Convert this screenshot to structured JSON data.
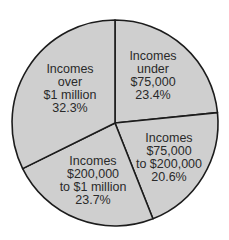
{
  "chart_data": {
    "type": "pie",
    "title": "",
    "categories": [
      "Incomes under $75,000",
      "Incomes $75,000 to $200,000",
      "Incomes $200,000 to $1 million",
      "Incomes over $1 million"
    ],
    "values": [
      23.4,
      20.6,
      23.7,
      32.3
    ],
    "unit": "%",
    "start_angle_deg": 90,
    "direction": "clockwise",
    "legend": "none (labels inside slices)",
    "slices": [
      {
        "lines": [
          "Incomes",
          "under",
          "$75,000",
          "23.4%"
        ],
        "value": 23.4,
        "label_pos": [
          153,
          76
        ]
      },
      {
        "lines": [
          "Incomes",
          "$75,000",
          "to $200,000",
          "20.6%"
        ],
        "value": 20.6,
        "label_pos": [
          169,
          158
        ]
      },
      {
        "lines": [
          "Incomes",
          "$200,000",
          "to $1 million",
          "23.7%"
        ],
        "value": 23.7,
        "label_pos": [
          93,
          181
        ]
      },
      {
        "lines": [
          "Incomes",
          "over",
          "$1 million",
          "32.3%"
        ],
        "value": 32.3,
        "label_pos": [
          70,
          89
        ]
      }
    ]
  },
  "style": {
    "fill": "#cfcfcf",
    "stroke": "#1c1c1c",
    "background": "#ffffff",
    "center": [
      115,
      123
    ],
    "radius": 103
  }
}
